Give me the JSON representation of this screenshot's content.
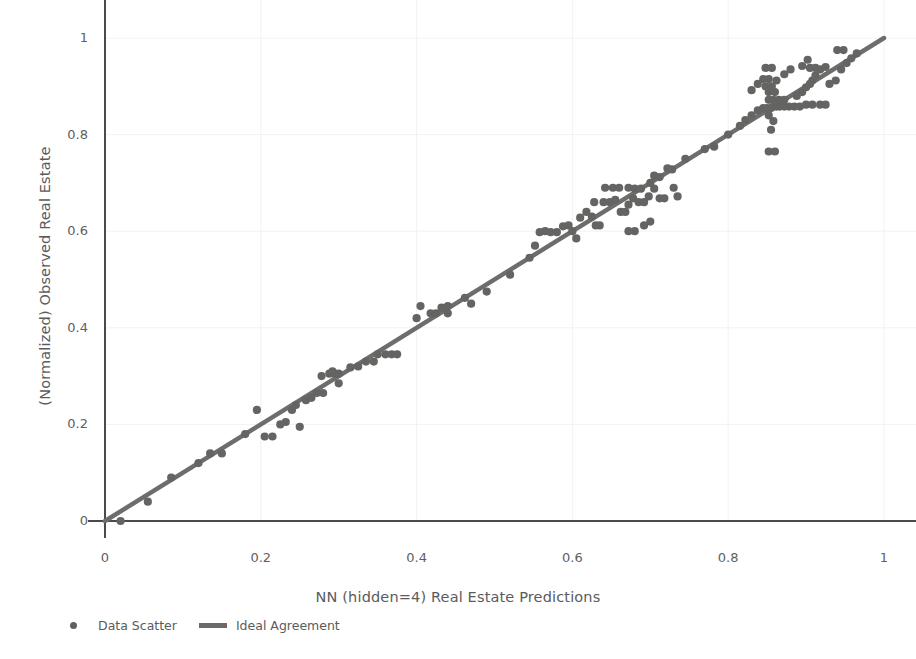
{
  "chart_data": {
    "type": "scatter",
    "title": "",
    "xlabel": "NN (hidden=4) Real Estate Predictions",
    "ylabel": "(Normalized) Observed Real Estate",
    "xlim": [
      0,
      1.05
    ],
    "ylim": [
      0,
      1.03
    ],
    "xticks": [
      0,
      0.2,
      0.4,
      0.6,
      0.8,
      1
    ],
    "xtick_labels": [
      "0",
      "0.2",
      "0.4",
      "0.6",
      "0.8",
      "1"
    ],
    "yticks": [
      0,
      0.2,
      0.4,
      0.6,
      0.8,
      1
    ],
    "ytick_labels": [
      "0",
      "0.2",
      "0.4",
      "0.6",
      "0.8",
      "1"
    ],
    "grid": true,
    "legend_position": "bottom-left",
    "marker_color": "#646463",
    "line_color": "#6d6d6c",
    "axis_color": "#4a4a4a",
    "grid_color": "#f2f2f2",
    "series": [
      {
        "name": "Data Scatter",
        "type": "scatter",
        "marker": "circle",
        "points": [
          [
            0.02,
            0.0
          ],
          [
            0.055,
            0.04
          ],
          [
            0.085,
            0.09
          ],
          [
            0.12,
            0.12
          ],
          [
            0.135,
            0.14
          ],
          [
            0.15,
            0.14
          ],
          [
            0.18,
            0.18
          ],
          [
            0.195,
            0.23
          ],
          [
            0.205,
            0.175
          ],
          [
            0.215,
            0.175
          ],
          [
            0.225,
            0.2
          ],
          [
            0.232,
            0.205
          ],
          [
            0.24,
            0.23
          ],
          [
            0.245,
            0.24
          ],
          [
            0.25,
            0.195
          ],
          [
            0.258,
            0.25
          ],
          [
            0.265,
            0.255
          ],
          [
            0.272,
            0.265
          ],
          [
            0.28,
            0.265
          ],
          [
            0.278,
            0.3
          ],
          [
            0.288,
            0.305
          ],
          [
            0.295,
            0.305
          ],
          [
            0.3,
            0.305
          ],
          [
            0.292,
            0.31
          ],
          [
            0.3,
            0.285
          ],
          [
            0.315,
            0.318
          ],
          [
            0.325,
            0.32
          ],
          [
            0.335,
            0.33
          ],
          [
            0.345,
            0.33
          ],
          [
            0.35,
            0.345
          ],
          [
            0.36,
            0.345
          ],
          [
            0.368,
            0.345
          ],
          [
            0.375,
            0.345
          ],
          [
            0.4,
            0.42
          ],
          [
            0.405,
            0.445
          ],
          [
            0.418,
            0.43
          ],
          [
            0.425,
            0.43
          ],
          [
            0.432,
            0.442
          ],
          [
            0.44,
            0.445
          ],
          [
            0.44,
            0.43
          ],
          [
            0.462,
            0.462
          ],
          [
            0.47,
            0.45
          ],
          [
            0.49,
            0.475
          ],
          [
            0.52,
            0.51
          ],
          [
            0.545,
            0.545
          ],
          [
            0.552,
            0.57
          ],
          [
            0.558,
            0.598
          ],
          [
            0.565,
            0.6
          ],
          [
            0.572,
            0.598
          ],
          [
            0.58,
            0.598
          ],
          [
            0.588,
            0.61
          ],
          [
            0.595,
            0.612
          ],
          [
            0.6,
            0.6
          ],
          [
            0.605,
            0.585
          ],
          [
            0.61,
            0.628
          ],
          [
            0.618,
            0.64
          ],
          [
            0.625,
            0.63
          ],
          [
            0.63,
            0.612
          ],
          [
            0.635,
            0.612
          ],
          [
            0.628,
            0.66
          ],
          [
            0.64,
            0.66
          ],
          [
            0.648,
            0.66
          ],
          [
            0.642,
            0.69
          ],
          [
            0.652,
            0.69
          ],
          [
            0.66,
            0.69
          ],
          [
            0.655,
            0.665
          ],
          [
            0.662,
            0.64
          ],
          [
            0.668,
            0.64
          ],
          [
            0.672,
            0.655
          ],
          [
            0.678,
            0.668
          ],
          [
            0.672,
            0.69
          ],
          [
            0.68,
            0.688
          ],
          [
            0.688,
            0.688
          ],
          [
            0.685,
            0.66
          ],
          [
            0.692,
            0.66
          ],
          [
            0.698,
            0.672
          ],
          [
            0.7,
            0.7
          ],
          [
            0.705,
            0.688
          ],
          [
            0.712,
            0.668
          ],
          [
            0.718,
            0.668
          ],
          [
            0.705,
            0.715
          ],
          [
            0.712,
            0.712
          ],
          [
            0.7,
            0.62
          ],
          [
            0.692,
            0.612
          ],
          [
            0.68,
            0.6
          ],
          [
            0.672,
            0.6
          ],
          [
            0.73,
            0.69
          ],
          [
            0.735,
            0.672
          ],
          [
            0.722,
            0.73
          ],
          [
            0.728,
            0.728
          ],
          [
            0.745,
            0.75
          ],
          [
            0.77,
            0.77
          ],
          [
            0.782,
            0.775
          ],
          [
            0.8,
            0.8
          ],
          [
            0.815,
            0.818
          ],
          [
            0.822,
            0.83
          ],
          [
            0.83,
            0.84
          ],
          [
            0.838,
            0.85
          ],
          [
            0.845,
            0.855
          ],
          [
            0.85,
            0.855
          ],
          [
            0.855,
            0.855
          ],
          [
            0.858,
            0.858
          ],
          [
            0.862,
            0.858
          ],
          [
            0.866,
            0.858
          ],
          [
            0.872,
            0.858
          ],
          [
            0.878,
            0.858
          ],
          [
            0.885,
            0.858
          ],
          [
            0.892,
            0.858
          ],
          [
            0.852,
            0.872
          ],
          [
            0.858,
            0.872
          ],
          [
            0.865,
            0.872
          ],
          [
            0.872,
            0.872
          ],
          [
            0.852,
            0.888
          ],
          [
            0.86,
            0.888
          ],
          [
            0.848,
            0.9
          ],
          [
            0.856,
            0.9
          ],
          [
            0.845,
            0.915
          ],
          [
            0.852,
            0.915
          ],
          [
            0.862,
            0.912
          ],
          [
            0.848,
            0.938
          ],
          [
            0.856,
            0.938
          ],
          [
            0.838,
            0.905
          ],
          [
            0.83,
            0.892
          ],
          [
            0.852,
            0.84
          ],
          [
            0.858,
            0.828
          ],
          [
            0.855,
            0.81
          ],
          [
            0.852,
            0.765
          ],
          [
            0.86,
            0.765
          ],
          [
            0.888,
            0.88
          ],
          [
            0.895,
            0.888
          ],
          [
            0.9,
            0.898
          ],
          [
            0.905,
            0.905
          ],
          [
            0.908,
            0.912
          ],
          [
            0.912,
            0.922
          ],
          [
            0.905,
            0.938
          ],
          [
            0.912,
            0.938
          ],
          [
            0.9,
            0.862
          ],
          [
            0.908,
            0.862
          ],
          [
            0.918,
            0.862
          ],
          [
            0.925,
            0.862
          ],
          [
            0.895,
            0.942
          ],
          [
            0.902,
            0.955
          ],
          [
            0.93,
            0.905
          ],
          [
            0.938,
            0.912
          ],
          [
            0.945,
            0.935
          ],
          [
            0.952,
            0.948
          ],
          [
            0.958,
            0.958
          ],
          [
            0.965,
            0.968
          ],
          [
            0.94,
            0.975
          ],
          [
            0.948,
            0.975
          ],
          [
            0.925,
            0.94
          ],
          [
            0.918,
            0.935
          ],
          [
            0.88,
            0.935
          ],
          [
            0.872,
            0.925
          ]
        ]
      },
      {
        "name": "Ideal Agreement",
        "type": "line",
        "x": [
          0,
          1
        ],
        "y": [
          0,
          1
        ]
      }
    ]
  },
  "legend": {
    "items": [
      {
        "label": "Data Scatter",
        "marker": "dot-marker"
      },
      {
        "label": "Ideal Agreement",
        "marker": "line-marker"
      }
    ]
  },
  "top_title": ""
}
